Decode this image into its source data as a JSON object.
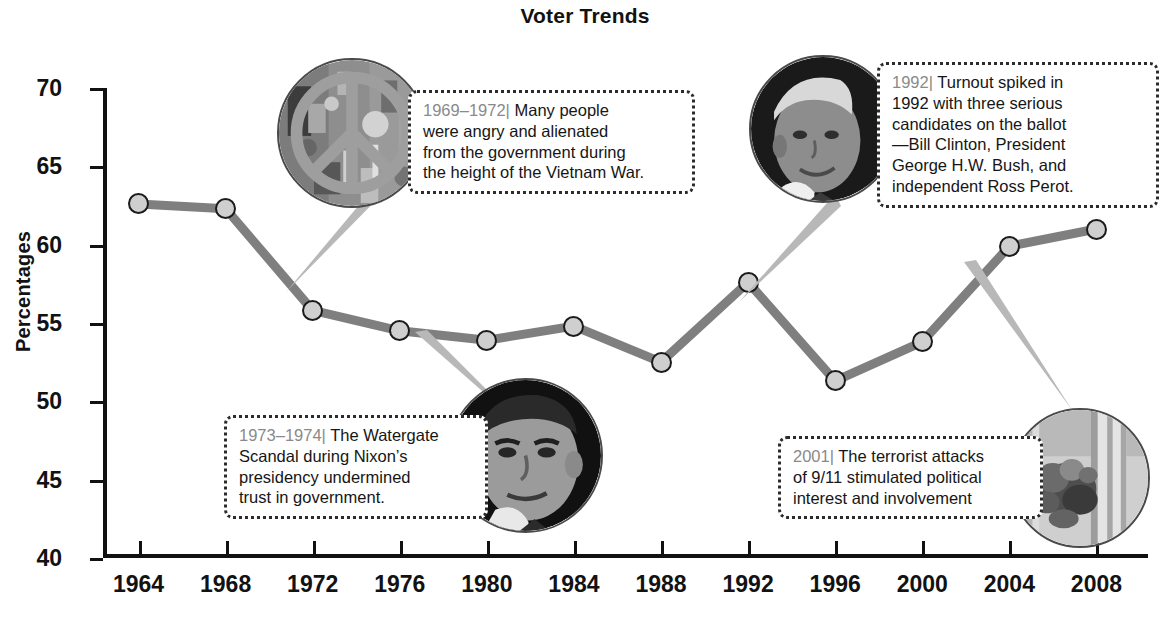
{
  "chart_data": {
    "type": "line",
    "title": "Voter Trends",
    "xlabel": "",
    "ylabel": "Percentages",
    "categories": [
      "1964",
      "1968",
      "1972",
      "1976",
      "1980",
      "1984",
      "1988",
      "1992",
      "1996",
      "2000",
      "2004",
      "2008"
    ],
    "x": [
      1964,
      1968,
      1972,
      1976,
      1980,
      1984,
      1988,
      1992,
      1996,
      2000,
      2004,
      2008
    ],
    "values": [
      62.6,
      62.3,
      55.8,
      54.5,
      53.9,
      54.8,
      52.5,
      57.6,
      51.3,
      53.8,
      59.9,
      61.0
    ],
    "series": [
      {
        "name": "Voter turnout",
        "values": [
          62.6,
          62.3,
          55.8,
          54.5,
          53.9,
          54.8,
          52.5,
          57.6,
          51.3,
          53.8,
          59.9,
          61.0
        ]
      }
    ],
    "ylim": [
      40,
      70
    ],
    "ytick_labels": [
      "70",
      "65",
      "60",
      "55",
      "50",
      "45",
      "40"
    ],
    "yticks": [
      70,
      65,
      60,
      55,
      50,
      45,
      40
    ],
    "grid": false,
    "legend": "none",
    "line_color": "#7f7f7f",
    "marker_fill": "#cfcfcf",
    "marker_edge": "#1b1b1b",
    "annotations": [
      {
        "id": "vietnam",
        "year_label": "1969–1972|",
        "text": "Many people were angry and alienated from the government during the height of the Vietnam War.",
        "anchor_year": 1972,
        "image": "peace-sign-protest-photo"
      },
      {
        "id": "turnout-1992",
        "year_label": "1992|",
        "text": "Turnout spiked in 1992 with three serious candidates on the ballot —Bill Clinton, President George H.W. Bush, and independent Ross Perot.",
        "anchor_year": 1992,
        "image": "bill-clinton-portrait-photo"
      },
      {
        "id": "watergate",
        "year_label": "1973–1974|",
        "text": "The Watergate Scandal during Nixon’s presidency undermined trust in government.",
        "anchor_year": 1976,
        "image": "richard-nixon-portrait-photo"
      },
      {
        "id": "september-eleven",
        "year_label": "2001|",
        "text": "The terrorist attacks of 9/11 stimulated political interest and involvement",
        "anchor_year": 2004,
        "image": "september-11-attack-photo"
      }
    ]
  },
  "callouts": {
    "vietnam": {
      "year": "1969–1972|",
      "line1": " Many people",
      "line2": "were angry and alienated",
      "line3": "from the government during",
      "line4": "the height of the Vietnam War."
    },
    "turnout1992": {
      "year": "1992|",
      "line1": " Turnout spiked in",
      "line2": "1992 with three serious",
      "line3": "candidates on the ballot",
      "line4": "—Bill Clinton, President",
      "line5": "George H.W. Bush, and",
      "line6": "independent Ross Perot."
    },
    "watergate": {
      "year": "1973–1974|",
      "line1": " The Watergate",
      "line2": "Scandal during Nixon’s",
      "line3": "presidency undermined",
      "line4": "trust in government."
    },
    "nineeleven": {
      "year": "2001|",
      "line1": " The terrorist attacks",
      "line2": "of 9/11 stimulated political",
      "line3": "interest and involvement"
    }
  }
}
